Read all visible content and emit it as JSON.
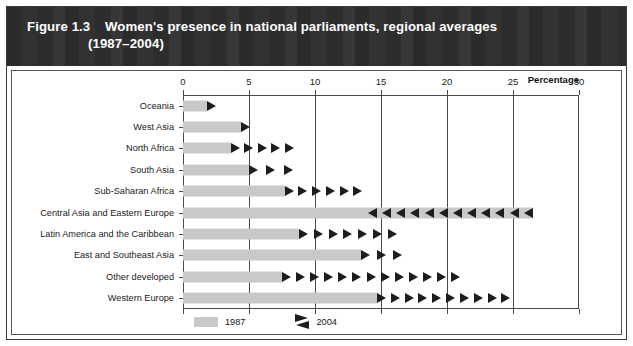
{
  "figure": {
    "number": "Figure 1.3",
    "title": "Women's presence in national parliaments, regional averages",
    "subtitle": "(1987–2004)",
    "axis_caption": "Percentage"
  },
  "legend": {
    "series_1987_label": "1987",
    "series_2004_label": "2004",
    "swatch_1987_color": "#c9c9c9",
    "marker_2004_color": "#1d1d1d"
  },
  "chart_data": {
    "type": "bar",
    "title": "Women's presence in national parliaments, regional averages (1987–2004)",
    "xlabel": "Percentage",
    "ylabel": "",
    "xlim": [
      0,
      30
    ],
    "xticks": [
      0,
      5,
      10,
      15,
      20,
      25,
      30
    ],
    "xtick_labels": [
      "0",
      "5",
      "10",
      "15",
      "20",
      "25",
      "30"
    ],
    "grid": true,
    "legend_position": "bottom-left",
    "orientation": "horizontal",
    "categories": [
      "Oceania",
      "West Asia",
      "North Africa",
      "South Asia",
      "Sub-Saharan Africa",
      "Central Asia and Eastern Europe",
      "Latin America and the Caribbean",
      "East and Southeast Asia",
      "Other developed",
      "Western Europe"
    ],
    "series": [
      {
        "name": "1987",
        "values": [
          1.8,
          4.4,
          3.6,
          5.0,
          7.7,
          26.5,
          8.8,
          13.5,
          7.5,
          14.7
        ]
      },
      {
        "name": "2004",
        "values": [
          2.6,
          5.2,
          8.4,
          8.3,
          13.6,
          14.0,
          16.2,
          16.6,
          21.0,
          24.8
        ]
      }
    ],
    "marker_direction": [
      "right",
      "right",
      "right",
      "right",
      "right",
      "left",
      "right",
      "right",
      "right",
      "right"
    ]
  },
  "rows": [
    {
      "label": "Oceania",
      "bar": 1.8,
      "from": 1.8,
      "to": 2.6,
      "dir": "right"
    },
    {
      "label": "West Asia",
      "bar": 4.4,
      "from": 4.4,
      "to": 5.2,
      "dir": "right"
    },
    {
      "label": "North Africa",
      "bar": 3.6,
      "from": 3.6,
      "to": 8.4,
      "dir": "right"
    },
    {
      "label": "South Asia",
      "bar": 5.0,
      "from": 5.0,
      "to": 8.3,
      "dir": "right"
    },
    {
      "label": "Sub-Saharan Africa",
      "bar": 7.7,
      "from": 7.7,
      "to": 13.6,
      "dir": "right"
    },
    {
      "label": "Central Asia and Eastern Europe",
      "bar": 26.5,
      "from": 26.5,
      "to": 14.0,
      "dir": "left"
    },
    {
      "label": "Latin America and the Caribbean",
      "bar": 8.8,
      "from": 8.8,
      "to": 16.2,
      "dir": "right"
    },
    {
      "label": "East and Southeast Asia",
      "bar": 13.5,
      "from": 13.5,
      "to": 16.6,
      "dir": "right"
    },
    {
      "label": "Other developed",
      "bar": 7.5,
      "from": 7.5,
      "to": 21.0,
      "dir": "right"
    },
    {
      "label": "Western Europe",
      "bar": 14.7,
      "from": 14.7,
      "to": 24.8,
      "dir": "right"
    }
  ]
}
